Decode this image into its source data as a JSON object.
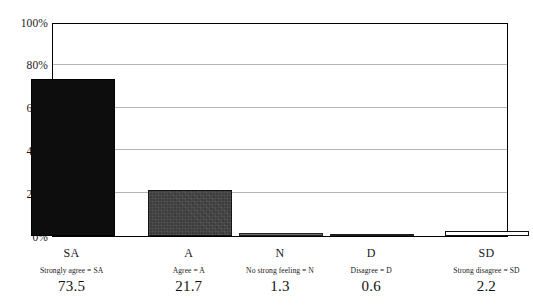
{
  "chart_data": {
    "type": "bar",
    "title": "",
    "subtitle": "",
    "xlabel": "",
    "ylabel": "",
    "categories": [
      "SA",
      "A",
      "N",
      "D",
      "SD"
    ],
    "category_legends": [
      "Strongly agree = SA",
      "Agree = A",
      "No strong feeling = N",
      "Disagree = D",
      "Strong disagree = SD"
    ],
    "values": [
      73.5,
      21.7,
      1.3,
      0.6,
      2.2
    ],
    "value_labels": [
      "73.5",
      "21.7",
      "1.3",
      "0.6",
      "2.2"
    ],
    "ylim": [
      0,
      100
    ],
    "y_ticks": [
      0,
      20,
      40,
      60,
      80,
      100
    ],
    "y_tick_labels": [
      "0%",
      "20%",
      "40%",
      "60%",
      "80%",
      "100%"
    ],
    "grid": true,
    "grid_axis": "y",
    "legend": "none",
    "bar_colors": [
      "#0d0d0d",
      "#3c3c3c",
      "#6e6e6e",
      "#555555",
      "#ffffff"
    ],
    "bar_border_color": "#111111",
    "gridline_color": "#b5b5b5",
    "frame_color": "#000000",
    "background_color": "#ffffff"
  }
}
